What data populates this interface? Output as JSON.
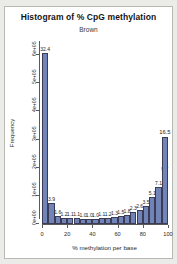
{
  "chart_data": {
    "type": "bar",
    "title": "Histogram of % CpG methylation",
    "subtitle": "Brown",
    "xlabel": "% methylation per base",
    "ylabel": "Frequency",
    "xlim": [
      0,
      100
    ],
    "ylim": [
      0,
      650000
    ],
    "grid": false,
    "legend": null,
    "bar_color": "#7184b8",
    "bar_border_color": "#3b3b55",
    "xticks": [
      "0",
      "20",
      "40",
      "60",
      "80",
      "100"
    ],
    "xtick_values": [
      0,
      20,
      40,
      60,
      80,
      100
    ],
    "yticks": [
      "0e+00",
      "1e+05",
      "2e+05",
      "3e+05",
      "4e+05",
      "5e+05",
      "6e+05"
    ],
    "ytick_values": [
      0,
      100000,
      200000,
      300000,
      400000,
      500000,
      600000
    ],
    "bin_width": 5,
    "categories": [
      "0-5",
      "5-10",
      "10-15",
      "15-20",
      "20-25",
      "25-30",
      "30-35",
      "35-40",
      "40-45",
      "45-50",
      "50-55",
      "55-60",
      "60-65",
      "65-70",
      "70-75",
      "75-80",
      "80-85",
      "85-90",
      "90-95",
      "95-100"
    ],
    "x": [
      2.5,
      7.5,
      12.5,
      17.5,
      22.5,
      27.5,
      32.5,
      37.5,
      42.5,
      47.5,
      52.5,
      57.5,
      62.5,
      67.5,
      72.5,
      77.5,
      82.5,
      87.5,
      92.5,
      97.5
    ],
    "percent_labels": [
      "32.4",
      "3.9",
      "1.6",
      "1.2",
      "1.1",
      "1.1",
      "1.0",
      "1.0",
      "1.0",
      "1.1",
      "1.2",
      "1.3",
      "1.5",
      "1.8",
      "2.3",
      "2.6",
      "3.5",
      "5.1",
      "7.1",
      "9.7"
    ],
    "values": [
      607000,
      73000,
      30000,
      22000,
      20500,
      20500,
      19000,
      19000,
      19000,
      20500,
      22000,
      24000,
      28000,
      33000,
      43000,
      49000,
      65000,
      95000,
      133000,
      181000
    ],
    "annotations": [
      {
        "text": "32.4",
        "x": 2.5,
        "y": 607000
      },
      {
        "text": "3.9",
        "x": 7.5,
        "y": 73000
      },
      {
        "text": "1.6",
        "x": 12.5,
        "y": 30000
      },
      {
        "text": "1.2",
        "x": 17.5,
        "y": 22000
      },
      {
        "text": "1.1",
        "x": 22.5,
        "y": 20500
      },
      {
        "text": "1.1",
        "x": 27.5,
        "y": 20500
      },
      {
        "text": "1.0",
        "x": 32.5,
        "y": 19000
      },
      {
        "text": "1.0",
        "x": 37.5,
        "y": 19000
      },
      {
        "text": "1.0",
        "x": 42.5,
        "y": 19000
      },
      {
        "text": "1.1",
        "x": 47.5,
        "y": 20500
      },
      {
        "text": "1.2",
        "x": 52.5,
        "y": 22000
      },
      {
        "text": "1.3",
        "x": 57.5,
        "y": 24000
      },
      {
        "text": "1.5",
        "x": 62.5,
        "y": 28000
      },
      {
        "text": "1.8",
        "x": 67.5,
        "y": 33000
      },
      {
        "text": "2.3",
        "x": 72.5,
        "y": 43000
      },
      {
        "text": "2.6",
        "x": 77.5,
        "y": 49000
      },
      {
        "text": "3.5",
        "x": 82.5,
        "y": 65000
      },
      {
        "text": "5.1",
        "x": 87.5,
        "y": 95000
      },
      {
        "text": "7.1",
        "x": 92.5,
        "y": 133000
      },
      {
        "text": "9.7",
        "x": 97.5,
        "y": 181000
      },
      {
        "text": "16.5",
        "x": 100,
        "y": 310000
      }
    ]
  }
}
